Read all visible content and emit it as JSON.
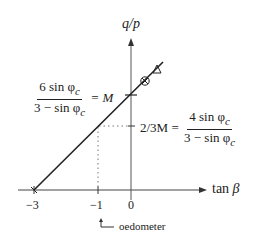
{
  "diagram": {
    "y_axis": {
      "label": "q/p"
    },
    "x_axis": {
      "label": "tan β",
      "label_plain": "tan",
      "label_symbol": "β"
    },
    "x_ticks": [
      "−3",
      "−1",
      "0"
    ],
    "annotations": {
      "M_left": {
        "numerator": "6 sin φ",
        "numerator_sub": "c",
        "denominator": "3 − sin φ",
        "denominator_sub": "c",
        "equals": "= M"
      },
      "two_thirds_M": {
        "prefix": "2/3M =",
        "numerator": "4 sin φ",
        "numerator_sub": "c",
        "denominator": "3 − sin φ",
        "denominator_sub": "c"
      },
      "oedometer": "oedometer"
    },
    "markers": [
      "circle-cross",
      "triangle"
    ],
    "colors": {
      "line": "#222222",
      "axis": "#555555",
      "dotted": "#777777"
    }
  }
}
